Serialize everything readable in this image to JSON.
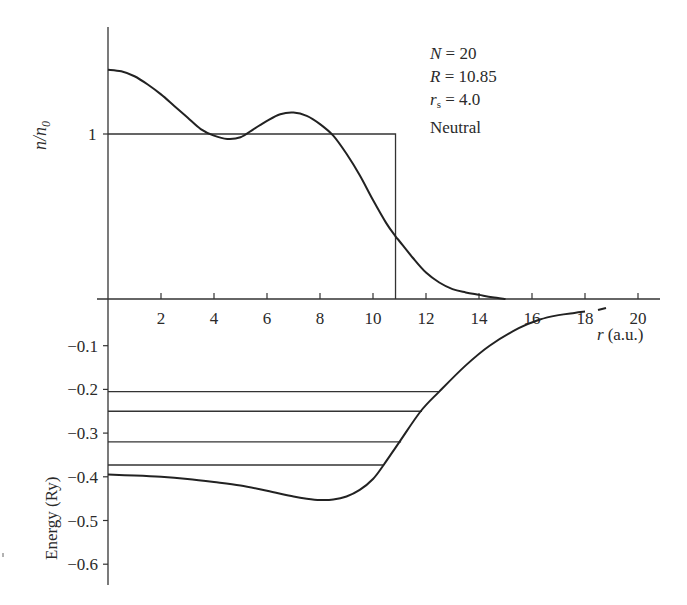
{
  "chart_data": [
    {
      "type": "line",
      "panel": "density",
      "title": "",
      "xlabel": "r (a.u.)",
      "ylabel": "n/n0",
      "xlim": [
        0,
        21
      ],
      "ylim": [
        0,
        1.65
      ],
      "grid": false,
      "y_ticks": [
        {
          "value": 1,
          "label": "1"
        }
      ],
      "x_ticks": [
        2,
        4,
        6,
        8,
        10,
        12,
        14,
        16,
        18,
        20
      ],
      "series": [
        {
          "name": "self-consistent electron density",
          "x": [
            0,
            0.5,
            1,
            1.5,
            2,
            2.5,
            3,
            3.5,
            4,
            4.5,
            5,
            5.5,
            6,
            6.5,
            7,
            7.5,
            8,
            8.5,
            9,
            9.5,
            10,
            10.5,
            10.85,
            11,
            11.5,
            12,
            12.5,
            13,
            13.5,
            14,
            14.5,
            15
          ],
          "values": [
            1.39,
            1.38,
            1.35,
            1.3,
            1.24,
            1.17,
            1.1,
            1.03,
            0.99,
            0.97,
            0.98,
            1.03,
            1.08,
            1.12,
            1.13,
            1.11,
            1.06,
            0.99,
            0.88,
            0.75,
            0.6,
            0.46,
            0.38,
            0.35,
            0.25,
            0.16,
            0.1,
            0.06,
            0.04,
            0.025,
            0.01,
            0.0
          ]
        },
        {
          "name": "jellium step background",
          "x": [
            0,
            10.85,
            10.85
          ],
          "values": [
            1.0,
            1.0,
            0.0
          ]
        }
      ],
      "annotations": [
        {
          "text": "N = 20"
        },
        {
          "text": "R = 10.85"
        },
        {
          "text": "rs = 4.0"
        },
        {
          "text": "Neutral"
        }
      ]
    },
    {
      "type": "line",
      "panel": "potential",
      "title": "",
      "xlabel": "r (a.u.)",
      "ylabel": "Energy (Ry)",
      "xlim": [
        0,
        21
      ],
      "ylim": [
        -0.63,
        0
      ],
      "grid": false,
      "y_ticks": [
        -0.1,
        -0.2,
        -0.3,
        -0.4,
        -0.5,
        -0.6
      ],
      "series": [
        {
          "name": "effective potential",
          "x": [
            0,
            1,
            2,
            3,
            4,
            5,
            6,
            7,
            7.5,
            8,
            8.5,
            9,
            9.5,
            10,
            10.4,
            11,
            11.8,
            12.5,
            13.5,
            14.4,
            15.5,
            16.3,
            17.0,
            17.6,
            18.0
          ],
          "values": [
            -0.395,
            -0.397,
            -0.4,
            -0.405,
            -0.412,
            -0.42,
            -0.432,
            -0.445,
            -0.45,
            -0.453,
            -0.452,
            -0.445,
            -0.43,
            -0.405,
            -0.373,
            -0.32,
            -0.25,
            -0.205,
            -0.145,
            -0.1,
            -0.06,
            -0.04,
            -0.03,
            -0.025,
            -0.022
          ]
        }
      ],
      "energy_levels": [
        {
          "energy": -0.205,
          "r_end": 12.5
        },
        {
          "energy": -0.25,
          "r_end": 11.85
        },
        {
          "energy": -0.32,
          "r_end": 11.06
        },
        {
          "energy": -0.373,
          "r_end": 10.42
        }
      ]
    }
  ],
  "labels": {
    "y_top": "n/n",
    "y_top_sub": "0",
    "y_top_one": "1",
    "y_bottom": "Energy (Ry)",
    "x_axis_var": "r",
    "x_axis_unit": "(a.u.)",
    "x_ticks": [
      "2",
      "4",
      "6",
      "8",
      "10",
      "12",
      "14",
      "16",
      "18",
      "20"
    ],
    "energy_ticks": [
      "−0.1",
      "−0.2",
      "−0.3",
      "−0.4",
      "−0.5",
      "−0.6"
    ]
  },
  "params": {
    "n_var": "N",
    "n_val": " = 20",
    "r_var": "R",
    "r_val": " = 10.85",
    "rs_var": "r",
    "rs_sub": "s",
    "rs_val": " = 4.0",
    "charge": "Neutral"
  },
  "colors": {
    "line": "#222222",
    "axis": "#333333",
    "text": "#2a2a2a",
    "background": "#ffffff"
  }
}
